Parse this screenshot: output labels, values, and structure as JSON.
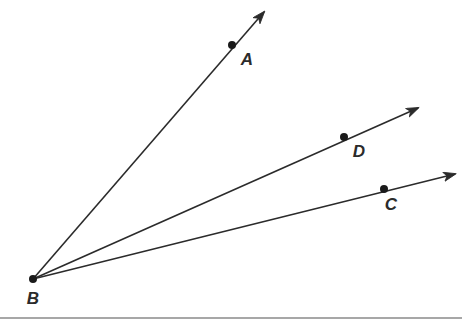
{
  "figure": {
    "kind": "geometry-diagram",
    "background_color": "#ffffff",
    "stroke_color": "#2b2b2b",
    "stroke_width": 1.6,
    "dot_color": "#1a1a1a",
    "dot_radius": 4,
    "label_color": "#2b2b2b",
    "label_font_size": 17,
    "vertex": {
      "name": "B",
      "label": "B",
      "x": 33,
      "y": 279,
      "label_x": 33,
      "label_y": 298,
      "has_dot": true
    },
    "rays": [
      {
        "name": "ray-BA",
        "through_point_label": "A",
        "origin": {
          "x": 33,
          "y": 279
        },
        "tip": {
          "x": 264,
          "y": 12
        },
        "dot": {
          "x": 232,
          "y": 45
        },
        "label_x": 247,
        "label_y": 59,
        "arrowhead": true
      },
      {
        "name": "ray-BD",
        "through_point_label": "D",
        "origin": {
          "x": 33,
          "y": 279
        },
        "tip": {
          "x": 418,
          "y": 108
        },
        "dot": {
          "x": 344,
          "y": 137
        },
        "label_x": 359,
        "label_y": 151,
        "arrowhead": true
      },
      {
        "name": "ray-BC",
        "through_point_label": "C",
        "origin": {
          "x": 33,
          "y": 279
        },
        "tip": {
          "x": 455,
          "y": 174
        },
        "dot": {
          "x": 384,
          "y": 189
        },
        "label_x": 391,
        "label_y": 204,
        "arrowhead": true
      }
    ],
    "footer_rule": {
      "name": "footer-rule",
      "x1": 0,
      "y1": 318,
      "x2": 462,
      "y2": 318,
      "color": "#8a8a8a",
      "width": 1.4
    }
  }
}
